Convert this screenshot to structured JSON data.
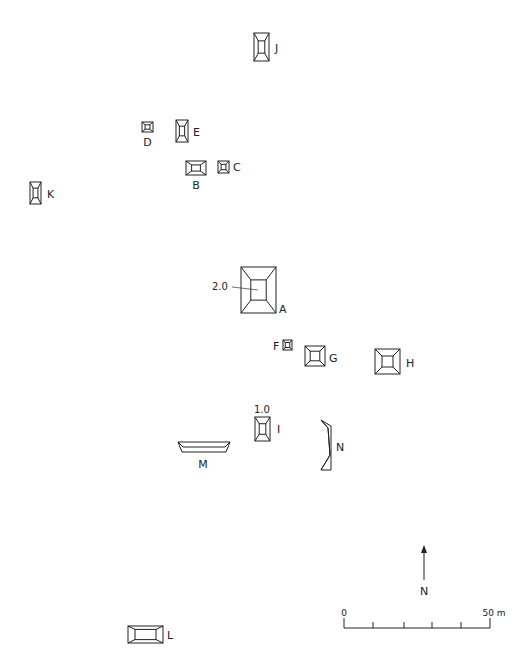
{
  "diagram": {
    "type": "archaeological-site-plan",
    "stroke_color": "#222222",
    "background": "#ffffff"
  },
  "structures": [
    {
      "id": "J",
      "label": "J",
      "x": 254,
      "y": 33,
      "w": 15,
      "h": 28,
      "inset": 0.28,
      "label_dx": 6,
      "label_dy": 19,
      "label_pos": "right"
    },
    {
      "id": "D",
      "label": "D",
      "x": 142,
      "y": 122,
      "w": 11,
      "h": 10,
      "inset": 0.28,
      "label_pos": "below",
      "label_dx": 0,
      "label_dy": 14
    },
    {
      "id": "E",
      "label": "E",
      "x": 176,
      "y": 120,
      "w": 12,
      "h": 22,
      "inset": 0.28,
      "label_pos": "right",
      "label_dx": 5,
      "label_dy": 16
    },
    {
      "id": "B",
      "label": "B",
      "x": 186,
      "y": 161,
      "w": 20,
      "h": 14,
      "inset": 0.28,
      "label_pos": "below",
      "label_dx": 0,
      "label_dy": 14
    },
    {
      "id": "C",
      "label": "C",
      "x": 218,
      "y": 161,
      "w": 11,
      "h": 12,
      "inset": 0.28,
      "label_pos": "right",
      "label_dx": 4,
      "label_dy": 10
    },
    {
      "id": "K",
      "label": "K",
      "x": 30,
      "y": 182,
      "w": 11,
      "h": 22,
      "inset": 0.28,
      "label_pos": "right",
      "label_dx": 6,
      "label_dy": 16
    },
    {
      "id": "A",
      "label": "A",
      "x": 241,
      "y": 267,
      "w": 35,
      "h": 46,
      "inset": 0.28,
      "label_pos": "right",
      "label_dx": 3,
      "label_dy": 46
    },
    {
      "id": "F",
      "label": "F",
      "x": 283,
      "y": 340,
      "w": 9,
      "h": 10,
      "inset": 0.25,
      "label_pos": "left",
      "label_dx": -10,
      "label_dy": 10
    },
    {
      "id": "G",
      "label": "G",
      "x": 305,
      "y": 346,
      "w": 20,
      "h": 20,
      "inset": 0.26,
      "label_pos": "right",
      "label_dx": 4,
      "label_dy": 16
    },
    {
      "id": "H",
      "label": "H",
      "x": 375,
      "y": 349,
      "w": 25,
      "h": 25,
      "inset": 0.28,
      "label_pos": "right",
      "label_dx": 6,
      "label_dy": 18
    },
    {
      "id": "I",
      "label": "I",
      "x": 255,
      "y": 417,
      "w": 15,
      "h": 24,
      "inset": 0.28,
      "label_pos": "right",
      "label_dx": 7,
      "label_dy": 16
    },
    {
      "id": "L",
      "label": "L",
      "x": 128,
      "y": 626,
      "w": 35,
      "h": 17,
      "inset": 0.2,
      "label_pos": "right",
      "label_dx": 4,
      "label_dy": 13
    }
  ],
  "irregular_structures": [
    {
      "id": "M",
      "label": "M",
      "label_x": 203,
      "label_y": 468,
      "outer": "178,442 230,442 226,452 182,452",
      "inner": "178,442 183,447 225,447 230,442"
    },
    {
      "id": "N",
      "label": "N",
      "label_x": 340,
      "label_y": 451,
      "outer": "321,420 331,426 331,470 321,470 330,455 328,428",
      "inner": "321,420 328,428 330,455 321,470"
    }
  ],
  "elevations": [
    {
      "text": "2.0",
      "x": 212,
      "y": 290,
      "leader": {
        "x1": 232,
        "y1": 287,
        "x2": 258,
        "y2": 290
      }
    },
    {
      "text": "1.0",
      "x": 254,
      "y": 413,
      "leader": null
    }
  ],
  "north_arrow": {
    "label": "N",
    "x": 424,
    "y_top": 545,
    "y_bottom": 580,
    "label_y": 595
  },
  "scale_bar": {
    "start_label": "0",
    "end_label": "50 m",
    "x_start": 344,
    "x_end": 490,
    "y": 628,
    "ticks": [
      344,
      373,
      404,
      432,
      461,
      490
    ]
  }
}
